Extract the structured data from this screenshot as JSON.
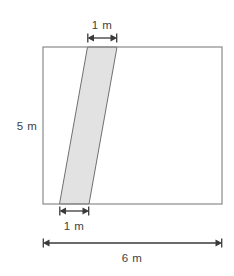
{
  "figure": {
    "colors": {
      "outline": "#8a8a8a",
      "shape_fill": "#e2e2e2",
      "shape_outline": "#707070",
      "dimension_line": "#3a3a3a",
      "label_text": "#414141",
      "background": "#ffffff"
    },
    "rectangle": {
      "name": "outer-rectangle",
      "width_label": "6 m",
      "height_label": "5 m",
      "width_value": 6,
      "height_value": 5,
      "units": "m"
    },
    "strip": {
      "name": "shaded-parallelogram",
      "top_width_label": "1 m",
      "bottom_width_label": "1 m",
      "top_width_value": 1,
      "bottom_width_value": 1,
      "units": "m"
    },
    "dimensions": [
      {
        "id": "top-width",
        "label": "1 m",
        "orientation": "horizontal",
        "position": "above-rectangle-top"
      },
      {
        "id": "bottom-strip-width",
        "label": "1 m",
        "orientation": "horizontal",
        "position": "below-rectangle-bottom"
      },
      {
        "id": "rectangle-height",
        "label": "5 m",
        "orientation": "vertical",
        "position": "left-of-rectangle"
      },
      {
        "id": "rectangle-width",
        "label": "6 m",
        "orientation": "horizontal",
        "position": "bottom-overall"
      }
    ]
  }
}
